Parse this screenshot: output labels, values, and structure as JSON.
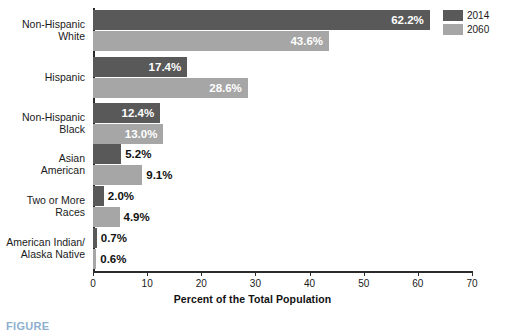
{
  "chart_data": {
    "type": "bar",
    "orientation": "horizontal",
    "title": "",
    "xlabel": "Percent of the Total Population",
    "ylabel": "",
    "xlim": [
      0,
      70
    ],
    "xticks": [
      0,
      10,
      20,
      30,
      40,
      50,
      60,
      70
    ],
    "grid": false,
    "legend_position": "top-right",
    "categories": [
      "Non-Hispanic\nWhite",
      "Hispanic",
      "Non-Hispanic\nBlack",
      "Asian\nAmerican",
      "Two or More\nRaces",
      "American Indian/\nAlaska Native"
    ],
    "series": [
      {
        "name": "2014",
        "color": "#595959",
        "values": [
          62.2,
          17.4,
          12.4,
          5.2,
          2.0,
          0.7
        ],
        "labels": [
          "62.2%",
          "17.4%",
          "12.4%",
          "5.2%",
          "2.0%",
          "0.7%"
        ]
      },
      {
        "name": "2060",
        "color": "#a6a6a6",
        "values": [
          43.6,
          28.6,
          13.0,
          9.1,
          4.9,
          0.6
        ],
        "labels": [
          "43.6%",
          "28.6%",
          "13.0%",
          "9.1%",
          "4.9%",
          "0.6%"
        ]
      }
    ]
  },
  "legend": {
    "entries": [
      {
        "label": "2014",
        "color": "#595959"
      },
      {
        "label": "2060",
        "color": "#a6a6a6"
      }
    ]
  },
  "caption": {
    "text": "FIGURE"
  }
}
